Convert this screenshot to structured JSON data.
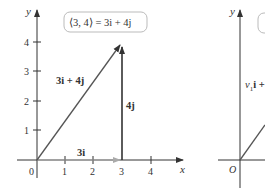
{
  "left_panel": {
    "y_axis_label": "y",
    "x_axis_label": "x",
    "origin_label": "0",
    "x_ticks": [
      "1",
      "2",
      "3",
      "4"
    ],
    "y_ticks": [
      "1",
      "2",
      "3",
      "4"
    ],
    "box_label": "⟨3, 4⟩ = 3i + 4j",
    "vector_label": "3i + 4j",
    "horizontal_label": "3i",
    "vertical_label": "4j"
  },
  "right_panel": {
    "y_axis_label": "y",
    "origin_label": "O",
    "vector_label_prefix": "v",
    "vector_label_sub": "1",
    "vector_label_suffix": "i +"
  },
  "colors": {
    "axis": "#333333",
    "vector": "#555555",
    "component_horizontal": "#aaaaaa",
    "box_border": "#bbbbbb"
  }
}
